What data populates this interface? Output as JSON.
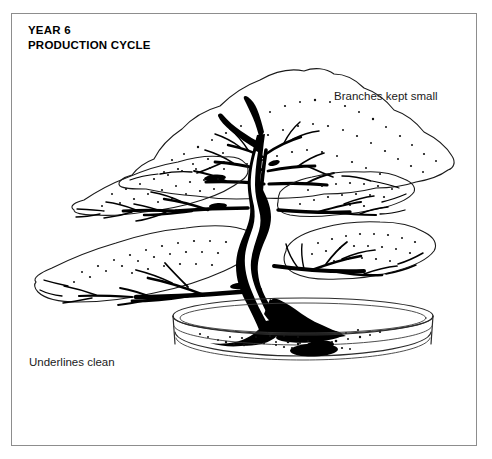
{
  "panel": {
    "title": "YEAR 6\nPRODUCTION CYCLE",
    "title_line1": "YEAR 6",
    "title_line2": "PRODUCTION CYCLE",
    "border_color": "#8d8d8d",
    "background_color": "#ffffff"
  },
  "annotations": [
    {
      "id": "branches-kept-small",
      "text": "Branches kept small"
    },
    {
      "id": "underlines-clean",
      "text": "Underlines clean"
    }
  ],
  "illustration": {
    "name": "bonsai-tree-diagram",
    "subject": "Informal upright bonsai tree in an oval training pot",
    "ink_color": "#000000",
    "elements": [
      "foliage-pad-top",
      "foliage-pad-left-middle",
      "foliage-pad-right-upper",
      "foliage-pad-right-lower",
      "foliage-pad-left-lower",
      "trunk",
      "surface-roots",
      "pot"
    ]
  }
}
